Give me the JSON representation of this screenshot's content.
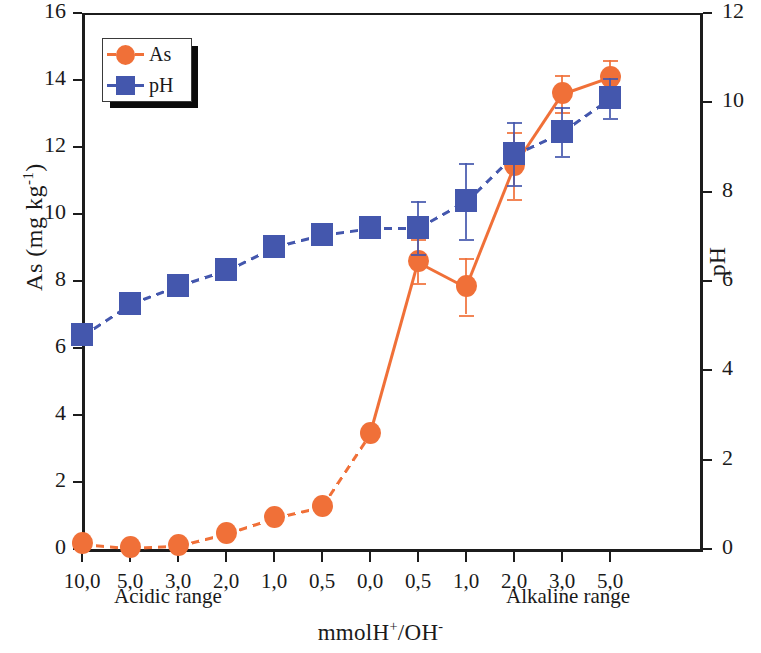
{
  "chart_data": {
    "type": "line",
    "title": "",
    "xlabel": "mmolH+/OH-",
    "ylabel": "As (mg kg-1)",
    "ylabel_right": "pH",
    "categories": [
      "10,0",
      "5,0",
      "3,0",
      "2,0",
      "1,0",
      "0,5",
      "0,0",
      "0,5",
      "1,0",
      "2,0",
      "3,0",
      "5,0"
    ],
    "ylim": [
      0,
      16
    ],
    "yticks": [
      0,
      2,
      4,
      6,
      8,
      10,
      12,
      14,
      16
    ],
    "ylim_right": [
      0,
      12
    ],
    "yticks_right": [
      0,
      2,
      4,
      6,
      8,
      10,
      12
    ],
    "grid": false,
    "legend_position": "top-left",
    "series": [
      {
        "name": "As",
        "axis": "left",
        "color": "#F07038",
        "marker": "circle",
        "linestyle": "dashed-to-solid",
        "values": [
          0.18,
          0.05,
          0.12,
          0.48,
          0.95,
          1.28,
          3.45,
          8.6,
          7.85,
          11.45,
          13.6,
          14.1
        ],
        "errors": [
          0,
          0,
          0,
          0,
          0,
          0,
          0,
          0.65,
          0.85,
          1.0,
          0.55,
          0.5
        ]
      },
      {
        "name": "pH",
        "axis": "right",
        "color": "#4457AD",
        "marker": "square",
        "linestyle": "dashed",
        "values": [
          4.8,
          5.5,
          5.9,
          6.25,
          6.78,
          7.05,
          7.2,
          7.2,
          7.8,
          8.85,
          9.35,
          10.1
        ],
        "errors": [
          0,
          0,
          0,
          0,
          0.1,
          0,
          0,
          0.6,
          0.85,
          0.7,
          0.55,
          0.45
        ]
      }
    ],
    "annotations": [
      {
        "text": "Acidic range",
        "position": "below-axis-left"
      },
      {
        "text": "Alkaline range",
        "position": "below-axis-right"
      }
    ]
  },
  "axes": {
    "left_title_main": "As (mg kg",
    "left_title_sup": "-1",
    "left_title_tail": ")",
    "right_title": "pH",
    "x_title_main": "mmolH",
    "x_title_sup1": "+",
    "x_title_mid": "/OH",
    "x_title_sup2": "-"
  },
  "labels": {
    "acidic": "Acidic range",
    "alkaline": "Alkaline range"
  },
  "legend": {
    "items": [
      {
        "label": "As",
        "color": "#F07038"
      },
      {
        "label": "pH",
        "color": "#4457AD"
      }
    ]
  }
}
